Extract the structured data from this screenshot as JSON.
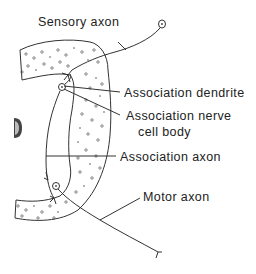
{
  "diagram": {
    "type": "reflex-arc",
    "colors": {
      "ink": "#222222",
      "background": "#ffffff"
    },
    "labels": {
      "sensory_axon": "Sensory axon",
      "association_dendrite": "Association dendrite",
      "association_nerve_cell_body_line1": "Association nerve",
      "association_nerve_cell_body_line2": "cell body",
      "association_axon": "Association axon",
      "motor_axon": "Motor axon"
    }
  }
}
